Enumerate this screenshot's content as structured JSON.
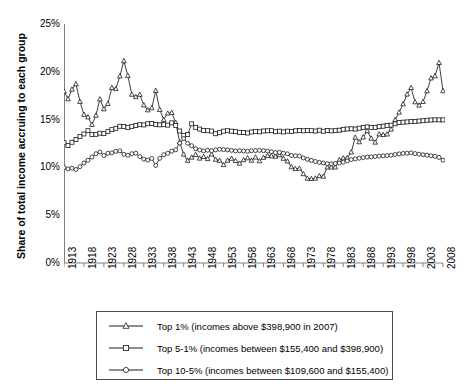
{
  "chart_data": {
    "type": "line",
    "title": "",
    "xlabel": "",
    "ylabel": "Share of total income accruing to each group",
    "xlim": [
      1913,
      2008
    ],
    "ylim": [
      0,
      25
    ],
    "yticks": [
      "0%",
      "5%",
      "10%",
      "15%",
      "20%",
      "25%"
    ],
    "ytick_values": [
      0,
      5,
      10,
      15,
      20,
      25
    ],
    "xticks": [
      "1913",
      "1918",
      "1923",
      "1928",
      "1933",
      "1938",
      "1943",
      "1948",
      "1953",
      "1958",
      "1963",
      "1968",
      "1973",
      "1978",
      "1983",
      "1988",
      "1993",
      "1998",
      "2003",
      "2008"
    ],
    "grid": false,
    "legend_position": "below",
    "x": [
      1913,
      1914,
      1915,
      1916,
      1917,
      1918,
      1919,
      1920,
      1921,
      1922,
      1923,
      1924,
      1925,
      1926,
      1927,
      1928,
      1929,
      1930,
      1931,
      1932,
      1933,
      1934,
      1935,
      1936,
      1937,
      1938,
      1939,
      1940,
      1941,
      1942,
      1943,
      1944,
      1945,
      1946,
      1947,
      1948,
      1949,
      1950,
      1951,
      1952,
      1953,
      1954,
      1955,
      1956,
      1957,
      1958,
      1959,
      1960,
      1961,
      1962,
      1963,
      1964,
      1965,
      1966,
      1967,
      1968,
      1969,
      1970,
      1971,
      1972,
      1973,
      1974,
      1975,
      1976,
      1977,
      1978,
      1979,
      1980,
      1981,
      1982,
      1983,
      1984,
      1985,
      1986,
      1987,
      1988,
      1989,
      1990,
      1991,
      1992,
      1993,
      1994,
      1995,
      1996,
      1997,
      1998,
      1999,
      2000,
      2001,
      2002,
      2003,
      2004,
      2005,
      2006,
      2007,
      2008
    ],
    "series": [
      {
        "name": "Top 1% (incomes above $398,900 in 2007)",
        "marker": "triangle",
        "values": [
          17.96,
          17.16,
          18.16,
          18.73,
          16.88,
          15.53,
          15.26,
          14.48,
          15.44,
          17.14,
          16.11,
          16.67,
          18.34,
          18.22,
          19.54,
          21.13,
          19.6,
          17.63,
          17.38,
          17.62,
          16.52,
          16.0,
          16.22,
          18.03,
          16.04,
          15.0,
          15.66,
          15.73,
          14.68,
          12.65,
          11.37,
          10.72,
          11.05,
          11.33,
          10.95,
          11.12,
          10.9,
          11.38,
          10.83,
          10.72,
          10.27,
          10.73,
          10.93,
          10.7,
          10.42,
          10.78,
          10.98,
          10.73,
          11.06,
          10.67,
          11.03,
          11.22,
          11.19,
          11.14,
          11.29,
          10.93,
          10.65,
          10.04,
          9.85,
          9.89,
          9.32,
          8.85,
          8.81,
          8.86,
          9.11,
          9.06,
          10.02,
          10.02,
          10.02,
          10.8,
          10.97,
          11.0,
          11.59,
          13.14,
          12.66,
          13.16,
          13.82,
          13.04,
          12.62,
          13.48,
          13.42,
          13.47,
          13.99,
          14.98,
          15.76,
          16.63,
          17.65,
          18.33,
          16.84,
          16.49,
          16.87,
          17.99,
          19.34,
          19.56,
          20.95,
          18.0
        ]
      },
      {
        "name": "Top 5-1% (incomes between $155,400 and $398,900)",
        "marker": "square",
        "values": [
          12.57,
          12.28,
          12.63,
          12.92,
          13.23,
          13.5,
          13.84,
          13.44,
          13.46,
          13.58,
          13.53,
          13.74,
          13.95,
          14.09,
          14.3,
          14.27,
          14.16,
          14.29,
          14.39,
          14.47,
          14.44,
          14.57,
          14.6,
          14.5,
          14.45,
          14.47,
          14.42,
          14.66,
          14.39,
          13.81,
          13.35,
          13.44,
          14.56,
          14.19,
          14.01,
          13.86,
          13.84,
          13.8,
          13.52,
          13.63,
          13.79,
          13.84,
          13.79,
          13.74,
          13.67,
          13.66,
          13.6,
          13.7,
          13.77,
          13.72,
          13.81,
          13.83,
          13.84,
          13.73,
          13.79,
          13.71,
          13.79,
          13.75,
          13.83,
          13.85,
          13.83,
          13.87,
          13.84,
          13.8,
          13.89,
          13.78,
          13.87,
          13.82,
          13.84,
          13.89,
          13.98,
          14.02,
          14.04,
          14.01,
          14.1,
          14.18,
          14.24,
          14.18,
          14.19,
          14.26,
          14.31,
          14.38,
          14.42,
          14.56,
          14.7,
          14.73,
          14.76,
          14.79,
          14.8,
          14.85,
          14.88,
          14.93,
          14.96,
          14.98,
          14.97,
          14.97
        ]
      },
      {
        "name": "Top 10-5% (incomes between $109,600 and $155,400)",
        "marker": "circle",
        "values": [
          9.97,
          9.84,
          9.91,
          9.78,
          10.08,
          10.46,
          10.75,
          11.08,
          11.43,
          11.61,
          11.24,
          11.48,
          11.52,
          11.68,
          11.73,
          11.37,
          11.26,
          11.43,
          11.49,
          11.13,
          10.87,
          10.77,
          10.93,
          10.2,
          10.95,
          11.33,
          11.48,
          11.7,
          11.84,
          12.54,
          13.02,
          12.52,
          12.27,
          11.95,
          11.82,
          11.73,
          11.8,
          11.74,
          11.83,
          11.9,
          11.86,
          11.83,
          11.78,
          11.72,
          11.74,
          11.72,
          11.69,
          11.74,
          11.76,
          11.78,
          11.75,
          11.71,
          11.64,
          11.55,
          11.58,
          11.49,
          11.42,
          11.25,
          11.22,
          11.18,
          10.99,
          10.85,
          10.73,
          10.62,
          10.53,
          10.46,
          10.39,
          10.37,
          10.41,
          10.46,
          10.55,
          10.68,
          10.82,
          10.89,
          10.96,
          11.03,
          11.08,
          11.1,
          11.14,
          11.18,
          11.21,
          11.24,
          11.27,
          11.35,
          11.41,
          11.46,
          11.49,
          11.52,
          11.45,
          11.38,
          11.32,
          11.28,
          11.22,
          11.16,
          11.05,
          10.76
        ]
      }
    ]
  },
  "legend": {
    "entries": [
      {
        "label": "Top 1% (incomes above $398,900 in 2007)",
        "marker": "triangle"
      },
      {
        "label": "Top 5-1% (incomes between $155,400 and $398,900)",
        "marker": "square"
      },
      {
        "label": "Top 10-5% (incomes between $109,600 and $155,400)",
        "marker": "circle"
      }
    ]
  },
  "colors": {
    "line": "#1a1a1a",
    "axis": "#808080",
    "legend_border": "#4d4d4d",
    "background": "#ffffff"
  }
}
